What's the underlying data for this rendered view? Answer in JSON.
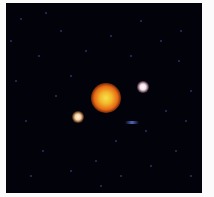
{
  "image": {
    "subject": "star field",
    "background_color": "#02030a",
    "page_color": "#fbfbfb",
    "field": {
      "x": 6,
      "y": 3,
      "width": 196,
      "height": 190
    },
    "objects": [
      {
        "name": "central-orange-star",
        "cx": 106,
        "cy": 98,
        "diameter": 30,
        "color": "#f3b82c"
      },
      {
        "name": "white-star-right",
        "cx": 143,
        "cy": 87,
        "diameter": 12,
        "color": "#f0e0e6"
      },
      {
        "name": "warm-star-left",
        "cx": 78,
        "cy": 117,
        "diameter": 12,
        "color": "#f2cfa0"
      },
      {
        "name": "faint-blue-streak",
        "cx": 132,
        "cy": 122,
        "color": "#5066c0"
      }
    ],
    "specks": [
      [
        20,
        18
      ],
      [
        45,
        12
      ],
      [
        60,
        30
      ],
      [
        38,
        55
      ],
      [
        15,
        80
      ],
      [
        25,
        120
      ],
      [
        42,
        150
      ],
      [
        70,
        170
      ],
      [
        95,
        160
      ],
      [
        120,
        175
      ],
      [
        150,
        165
      ],
      [
        175,
        150
      ],
      [
        185,
        120
      ],
      [
        190,
        90
      ],
      [
        178,
        60
      ],
      [
        160,
        40
      ],
      [
        140,
        20
      ],
      [
        110,
        35
      ],
      [
        85,
        50
      ],
      [
        130,
        55
      ],
      [
        165,
        110
      ],
      [
        55,
        95
      ],
      [
        30,
        175
      ],
      [
        190,
        175
      ],
      [
        100,
        185
      ],
      [
        145,
        130
      ],
      [
        70,
        75
      ],
      [
        115,
        140
      ],
      [
        180,
        30
      ],
      [
        10,
        40
      ]
    ]
  }
}
